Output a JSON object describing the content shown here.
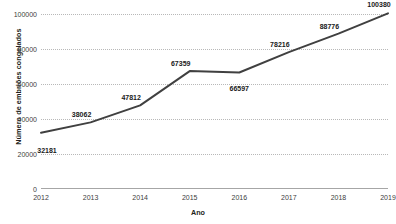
{
  "chart_data": {
    "type": "line",
    "title": "",
    "xlabel": "Ano",
    "ylabel": "Número de embriões congelados",
    "categories": [
      "2012",
      "2013",
      "2014",
      "2015",
      "2016",
      "2017",
      "2018",
      "2019"
    ],
    "x": [
      2012,
      2013,
      2014,
      2015,
      2016,
      2017,
      2018,
      2019
    ],
    "values": [
      32181,
      38062,
      47812,
      67359,
      66597,
      78216,
      88776,
      100380
    ],
    "point_labels": [
      "32181",
      "38062",
      "47812",
      "67359",
      "66597",
      "78216",
      "88776",
      "100380"
    ],
    "series": [
      {
        "name": "Número de embriões congelados",
        "values": [
          32181,
          38062,
          47812,
          67359,
          66597,
          78216,
          88776,
          100380
        ],
        "color": "#404040"
      }
    ],
    "ylim": [
      0,
      100000
    ],
    "yticks": [
      0,
      20000,
      40000,
      60000,
      80000,
      100000
    ],
    "ytick_labels": [
      "0",
      "20000",
      "40000",
      "60000",
      "80000",
      "100000"
    ],
    "xlim": [
      2012,
      2019
    ],
    "grid": "horizontal-dotted",
    "legend": "none",
    "line_color": "#404040",
    "grid_color": "#b8b8b8",
    "background": "#ffffff"
  }
}
